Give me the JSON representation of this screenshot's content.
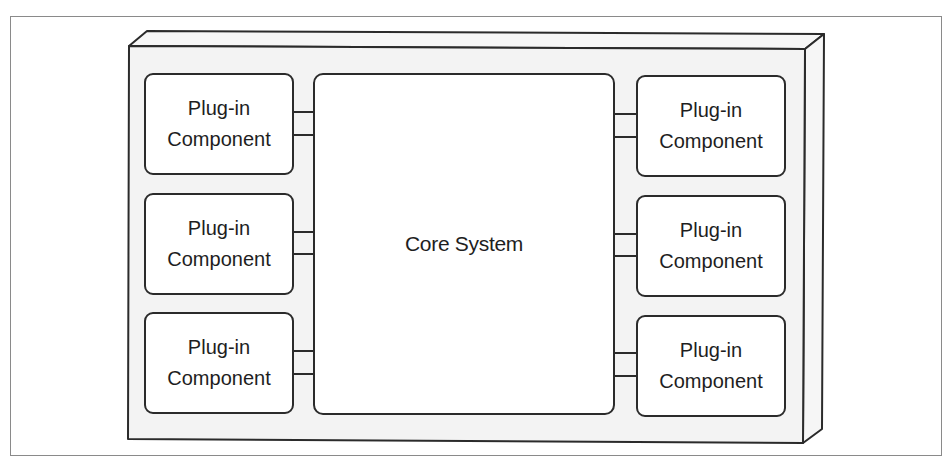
{
  "diagram": {
    "core": {
      "label": "Core System"
    },
    "left_plugins": [
      {
        "line1": "Plug-in",
        "line2": "Component"
      },
      {
        "line1": "Plug-in",
        "line2": "Component"
      },
      {
        "line1": "Plug-in",
        "line2": "Component"
      }
    ],
    "right_plugins": [
      {
        "line1": "Plug-in",
        "line2": "Component"
      },
      {
        "line1": "Plug-in",
        "line2": "Component"
      },
      {
        "line1": "Plug-in",
        "line2": "Component"
      }
    ],
    "connectors_per_plugin": 2
  },
  "colors": {
    "stroke": "#2b2b2b",
    "box_fill": "#ffffff",
    "container_fill": "#f3f3f3",
    "frame": "#8a8a8a"
  }
}
